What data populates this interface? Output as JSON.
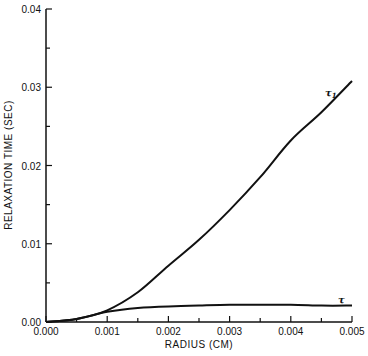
{
  "chart_data": {
    "type": "line",
    "title": "",
    "xlabel": "RADIUS (CM)",
    "ylabel": "RELAXATION TIME (SEC)",
    "xlim": [
      0.0,
      0.005
    ],
    "ylim": [
      0.0,
      0.04
    ],
    "grid": false,
    "legend": "inline labels at curve ends",
    "x_ticks": [
      "0.000",
      "0.001",
      "0.002",
      "0.003",
      "0.004",
      "0.005"
    ],
    "y_ticks": [
      "0.00",
      "0.01",
      "0.02",
      "0.03",
      "0.04"
    ],
    "x": [
      0.0,
      0.0005,
      0.001,
      0.0015,
      0.002,
      0.0025,
      0.003,
      0.0035,
      0.004,
      0.0045,
      0.005
    ],
    "series": [
      {
        "name": "τ₁",
        "values": [
          0.0,
          0.0004,
          0.0015,
          0.0038,
          0.0072,
          0.0105,
          0.0143,
          0.0185,
          0.0232,
          0.0268,
          0.0308
        ]
      },
      {
        "name": "τ",
        "values": [
          0.0,
          0.0004,
          0.0013,
          0.0018,
          0.002,
          0.0021,
          0.0022,
          0.0022,
          0.0022,
          0.0021,
          0.0021
        ]
      }
    ],
    "annotations": [
      {
        "text": "τ₁",
        "near": "upper curve end"
      },
      {
        "text": "τ",
        "near": "lower curve end"
      }
    ]
  },
  "labels": {
    "xlabel": "RADIUS (CM)",
    "ylabel": "RELAXATION TIME (SEC)",
    "curve_upper": "τ",
    "curve_upper_sub": "1",
    "curve_lower": "τ"
  }
}
